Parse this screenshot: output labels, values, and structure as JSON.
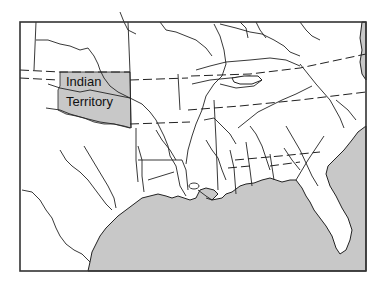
{
  "map": {
    "title": "",
    "region": "Southeastern United States",
    "labels": [
      {
        "id": "indian-territory",
        "lines": [
          "Indian",
          "Territory"
        ]
      }
    ],
    "colors": {
      "water": "#c8c8c8",
      "land": "#ffffff",
      "highlight": "#c8c8c8",
      "line": "#222222",
      "frame": "#333333"
    },
    "legend": []
  }
}
